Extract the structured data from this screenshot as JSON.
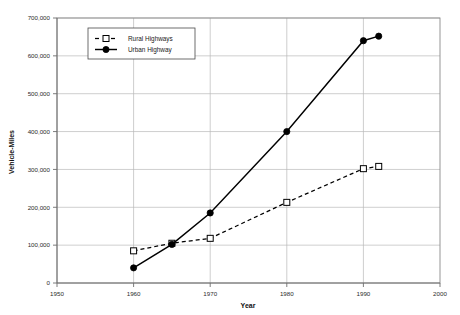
{
  "chart_data": {
    "type": "line",
    "title": "",
    "subtitle": "",
    "xlabel": "Year",
    "ylabel": "Vehicle-Miles",
    "xlim": [
      1950,
      2000
    ],
    "ylim": [
      0,
      700000
    ],
    "xticks": [
      1950,
      1960,
      1970,
      1980,
      1990,
      2000
    ],
    "xtick_labels": [
      "1950",
      "1960",
      "1970",
      "1980",
      "1990",
      "2000"
    ],
    "yticks": [
      0,
      100000,
      200000,
      300000,
      400000,
      500000,
      600000,
      700000
    ],
    "ytick_labels": [
      "0",
      "100,000",
      "200,000",
      "300,000",
      "400,000",
      "500,000",
      "600,000",
      "700,000"
    ],
    "grid": true,
    "grid_axis": "both",
    "legend_position": "top-left-inside",
    "series": [
      {
        "name": "Rural Highways",
        "marker": "open-square",
        "linestyle": "dashed",
        "color": "#000000",
        "points": [
          {
            "x": 1960,
            "y": 85000
          },
          {
            "x": 1965,
            "y": 105000
          },
          {
            "x": 1970,
            "y": 118000
          },
          {
            "x": 1980,
            "y": 213000
          },
          {
            "x": 1990,
            "y": 302000
          },
          {
            "x": 1992,
            "y": 308000
          }
        ]
      },
      {
        "name": "Urban Highway",
        "marker": "filled-circle",
        "linestyle": "solid",
        "color": "#000000",
        "points": [
          {
            "x": 1960,
            "y": 40000
          },
          {
            "x": 1965,
            "y": 102000
          },
          {
            "x": 1970,
            "y": 185000
          },
          {
            "x": 1980,
            "y": 400000
          },
          {
            "x": 1990,
            "y": 640000
          },
          {
            "x": 1992,
            "y": 652000
          }
        ]
      }
    ]
  },
  "legend": {
    "entries": [
      {
        "label": "Rural Highways"
      },
      {
        "label": "Urban Highway"
      }
    ]
  }
}
